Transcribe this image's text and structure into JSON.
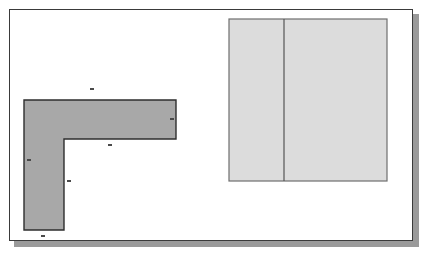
{
  "page": {
    "background_color": "#ffffff",
    "frame_border_color": "#3a3a3a",
    "frame_shadow_color": "#9a9a9a"
  },
  "diagram": {
    "type": "technical-floorplan-drawing",
    "shapes": [
      {
        "name": "l-shaped-region",
        "kind": "polygon",
        "fill_color": "#a8a8a8",
        "stroke_color": "#2e2e2e",
        "points": "24,100 176,100 176,139 64,139 64,230 24,230"
      },
      {
        "name": "light-rectangle-region",
        "kind": "rectangle",
        "fill_color": "#dcdcdc",
        "stroke_color": "#6e6e6e",
        "x": 229,
        "y": 19,
        "width": 158,
        "height": 162
      }
    ],
    "divider_line": {
      "name": "vertical-divider",
      "stroke_color": "#555555",
      "x": 284,
      "y1": 19,
      "y2": 181
    },
    "dimension_labels": [
      {
        "id": "top",
        "text": "",
        "x": 92,
        "y": 88,
        "orientation": "horizontal"
      },
      {
        "id": "right",
        "text": "",
        "x": 171,
        "y": 118,
        "orientation": "horizontal"
      },
      {
        "id": "inner-top",
        "text": "",
        "x": 110,
        "y": 144,
        "orientation": "horizontal"
      },
      {
        "id": "left",
        "text": "",
        "x": 28,
        "y": 159,
        "orientation": "horizontal"
      },
      {
        "id": "inner-vertical",
        "text": "",
        "x": 68,
        "y": 180,
        "orientation": "horizontal"
      },
      {
        "id": "bottom",
        "text": "",
        "x": 42,
        "y": 235,
        "orientation": "horizontal"
      }
    ]
  }
}
